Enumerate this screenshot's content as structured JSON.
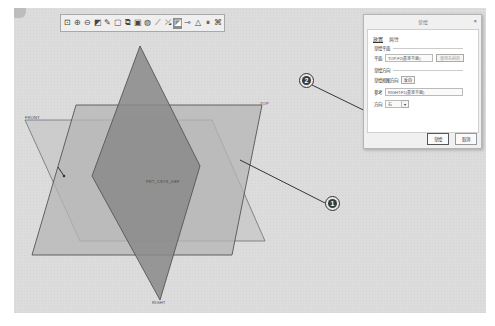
{
  "toolbar": {
    "buttons": [
      {
        "icon": "refit-icon",
        "glyph": "⊡"
      },
      {
        "icon": "zoom-in-icon",
        "glyph": "⊕"
      },
      {
        "icon": "zoom-out-icon",
        "glyph": "⊖"
      },
      {
        "icon": "repaint-icon",
        "glyph": "◩"
      },
      {
        "icon": "sketch-icon",
        "glyph": "✎"
      },
      {
        "icon": "annotation-icon",
        "glyph": "▢"
      },
      {
        "icon": "zoom-window-icon",
        "glyph": "⧉"
      },
      {
        "icon": "display-style-icon",
        "glyph": "▣"
      },
      {
        "icon": "saved-views-icon",
        "glyph": "◍"
      },
      {
        "icon": "view-manager-icon",
        "glyph": "⟋"
      },
      {
        "icon": "datum-display-icon",
        "glyph": "⤯"
      },
      {
        "icon": "plane-display-icon",
        "glyph": "◪",
        "active": true
      },
      {
        "icon": "axis-display-icon",
        "glyph": "⊸"
      },
      {
        "icon": "point-display-icon",
        "glyph": "△"
      },
      {
        "icon": "pause-icon",
        "glyph": "⏸"
      },
      {
        "icon": "csys-display-icon",
        "glyph": "⌘"
      }
    ]
  },
  "planes": {
    "front": {
      "label": "FRONT",
      "fill": "#c9c9c9"
    },
    "top": {
      "label": "TOP",
      "fill": "#b4b4b4"
    },
    "right": {
      "label": "RIGHT",
      "fill": "#8d8d8d"
    },
    "csys_label": "PRT_CSYS_DEF"
  },
  "callouts": [
    {
      "number": "1"
    },
    {
      "number": "2"
    }
  ],
  "dialog": {
    "title": "草绘",
    "close": "×",
    "tabs": [
      {
        "label": "放置",
        "active": true
      },
      {
        "label": "属性",
        "active": false
      }
    ],
    "sketch_plane": {
      "section": "草绘平面",
      "plane_label": "平面",
      "plane_value": "TOP:F2(基准平面)",
      "use_previous": "使用先前的"
    },
    "orientation": {
      "section": "草绘方向",
      "view_direction_label": "草绘视图方向",
      "flip_button": "反向",
      "reference_label": "参考",
      "reference_value": "RIGHT:F1(基准平面)",
      "direction_label": "方向",
      "direction_value": "右"
    },
    "footer": {
      "ok": "草绘",
      "cancel": "取消"
    }
  }
}
